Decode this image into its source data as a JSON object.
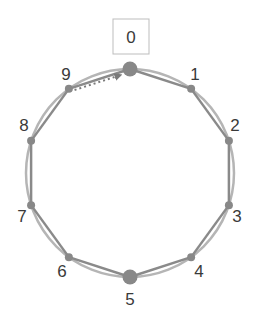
{
  "diagram": {
    "type": "ring",
    "node_count": 10,
    "center": [
      130,
      173
    ],
    "radius": 104,
    "highlighted_node_box_label": "0",
    "nodes": [
      {
        "id": "0",
        "label": "0",
        "large": true
      },
      {
        "id": "1",
        "label": "1",
        "large": false
      },
      {
        "id": "2",
        "label": "2",
        "large": false
      },
      {
        "id": "3",
        "label": "3",
        "large": false
      },
      {
        "id": "4",
        "label": "4",
        "large": false
      },
      {
        "id": "5",
        "label": "5",
        "large": true
      },
      {
        "id": "6",
        "label": "6",
        "large": false
      },
      {
        "id": "7",
        "label": "7",
        "large": false
      },
      {
        "id": "8",
        "label": "8",
        "large": false
      },
      {
        "id": "9",
        "label": "9",
        "large": false
      }
    ],
    "dotted_arrow": {
      "from": "9",
      "to": "0"
    },
    "colors": {
      "node": "#888888",
      "edge_chord": "#8a8a8a",
      "edge_arc": "#b5b5b5",
      "label": "#3a3a3a",
      "box_border": "#bdbdbd"
    }
  }
}
